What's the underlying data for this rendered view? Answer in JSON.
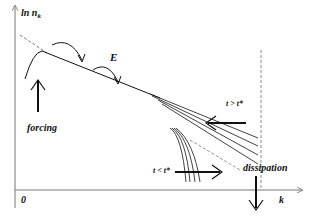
{
  "diagram": {
    "type": "energy-cascade-spectrum",
    "axes": {
      "y_label": "ln n",
      "y_label_subscript": "k",
      "x_label": "k",
      "origin_label": "0"
    },
    "labels": {
      "forcing": "forcing",
      "energy_flux": "E",
      "t_greater": "t > t*",
      "t_less": "t < t*",
      "dissipation": "dissipation"
    },
    "colors": {
      "ink": "#111111",
      "axis": "#666666",
      "dashed": "#777777",
      "background": "#ffffff"
    }
  }
}
